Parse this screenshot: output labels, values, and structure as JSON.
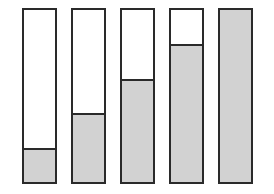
{
  "diagram": {
    "type": "fill-level-bars",
    "bars": [
      {
        "id": 1,
        "fill_percent": 20,
        "left": 22
      },
      {
        "id": 2,
        "fill_percent": 40,
        "left": 71
      },
      {
        "id": 3,
        "fill_percent": 60,
        "left": 120
      },
      {
        "id": 4,
        "fill_percent": 80,
        "left": 169
      },
      {
        "id": 5,
        "fill_percent": 100,
        "left": 218
      }
    ],
    "colors": {
      "outline": "#2a2a2a",
      "fill": "#d2d2d2",
      "empty": "#ffffff"
    }
  }
}
